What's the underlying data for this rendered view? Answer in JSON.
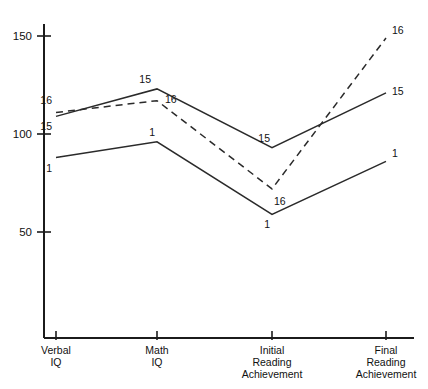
{
  "chart_data": {
    "type": "line",
    "title": "",
    "subtitle": "",
    "xlabel": "",
    "ylabel": "",
    "categories": [
      "Verbal IQ",
      "Math IQ",
      "Initial Reading Achievement",
      "Final Reading Achievement"
    ],
    "category_lines": [
      [
        "Verbal",
        "IQ"
      ],
      [
        "Math",
        "IQ"
      ],
      [
        "Initial",
        "Reading",
        "Achievement"
      ],
      [
        "Final",
        "Reading",
        "Achievement"
      ]
    ],
    "ylim": [
      0,
      160
    ],
    "yticks": [
      50,
      100,
      150
    ],
    "ytick_labels": [
      "50",
      "100",
      "150"
    ],
    "grid": false,
    "legend": "none",
    "series": [
      {
        "name": "15",
        "style": "solid",
        "values": [
          109,
          123,
          93,
          121
        ],
        "point_labels": [
          "15",
          "15",
          "15",
          "15"
        ]
      },
      {
        "name": "16",
        "style": "dashed",
        "values": [
          111,
          117,
          72,
          149
        ],
        "point_labels": [
          "16",
          "16",
          "16",
          "16"
        ]
      },
      {
        "name": "1",
        "style": "solid",
        "values": [
          88,
          96,
          59,
          86
        ],
        "point_labels": [
          "1",
          "1",
          "1",
          "1"
        ]
      }
    ]
  },
  "figure": {
    "background_color": "#ffffff",
    "line_color": "#2a2a2a",
    "axis_color": "#1b1b1b"
  }
}
